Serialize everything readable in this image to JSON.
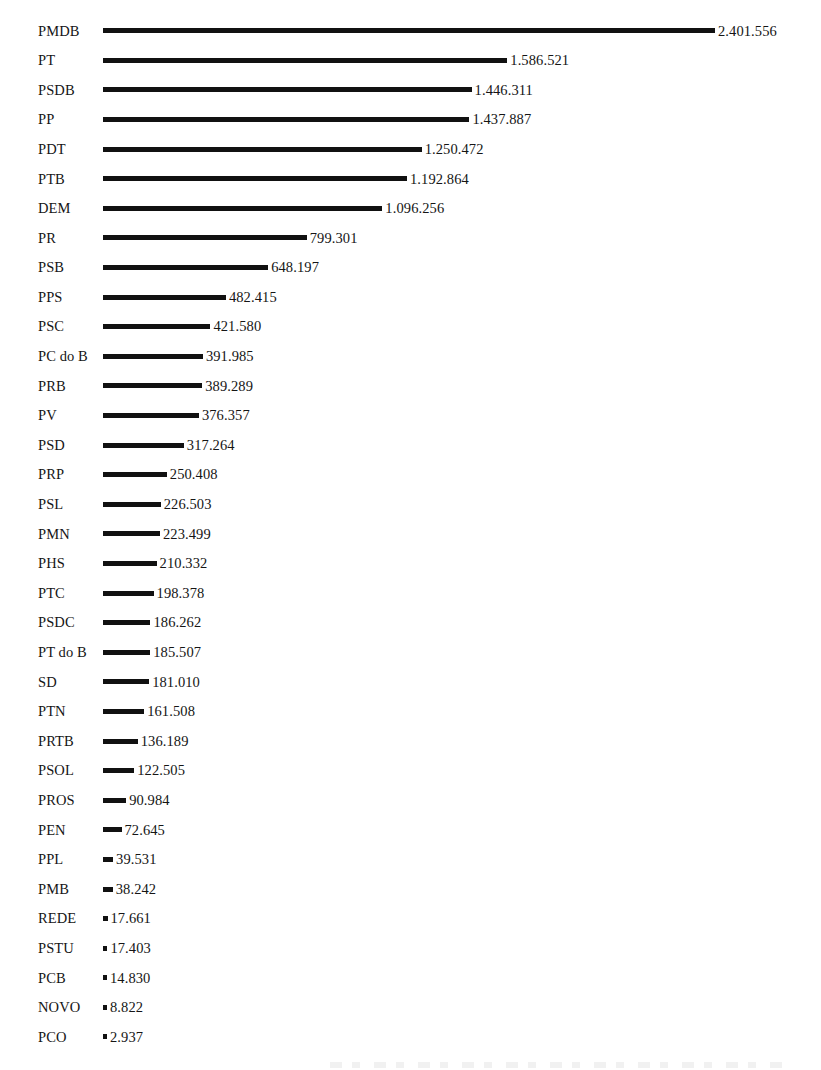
{
  "chart_data": {
    "type": "bar",
    "orientation": "horizontal",
    "title": "",
    "subtitle": "",
    "xlabel": "",
    "ylabel": "",
    "grid": false,
    "legend": null,
    "axis_visible": false,
    "value_labels_shown": true,
    "decimal_separator_style": "pt-BR (dot as thousands separator)",
    "xlim": [
      0,
      2401556
    ],
    "categories": [
      "PMDB",
      "PT",
      "PSDB",
      "PP",
      "PDT",
      "PTB",
      "DEM",
      "PR",
      "PSB",
      "PPS",
      "PSC",
      "PC do B",
      "PRB",
      "PV",
      "PSD",
      "PRP",
      "PSL",
      "PMN",
      "PHS",
      "PTC",
      "PSDC",
      "PT do B",
      "SD",
      "PTN",
      "PRTB",
      "PSOL",
      "PROS",
      "PEN",
      "PPL",
      "PMB",
      "REDE",
      "PSTU",
      "PCB",
      "NOVO",
      "PCO"
    ],
    "values": [
      2401556,
      1586521,
      1446311,
      1437887,
      1250472,
      1192864,
      1096256,
      799301,
      648197,
      482415,
      421580,
      391985,
      389289,
      376357,
      317264,
      250408,
      226503,
      223499,
      210332,
      198378,
      186262,
      185507,
      181010,
      161508,
      136189,
      122505,
      90984,
      72645,
      39531,
      38242,
      17661,
      17403,
      14830,
      8822,
      2937
    ],
    "value_labels": [
      "2.401.556",
      "1.586.521",
      "1.446.311",
      "1.437.887",
      "1.250.472",
      "1.192.864",
      "1.096.256",
      "799.301",
      "648.197",
      "482.415",
      "421.580",
      "391.985",
      "389.289",
      "376.357",
      "317.264",
      "250.408",
      "226.503",
      "223.499",
      "210.332",
      "198.378",
      "186.262",
      "185.507",
      "181.010",
      "161.508",
      "136.189",
      "122.505",
      "90.984",
      "72.645",
      "39.531",
      "38.242",
      "17.661",
      "17.403",
      "14.830",
      "8.822",
      "2.937"
    ],
    "colors": {
      "bar": "#111111",
      "text": "#151515",
      "background": "#ffffff"
    }
  }
}
